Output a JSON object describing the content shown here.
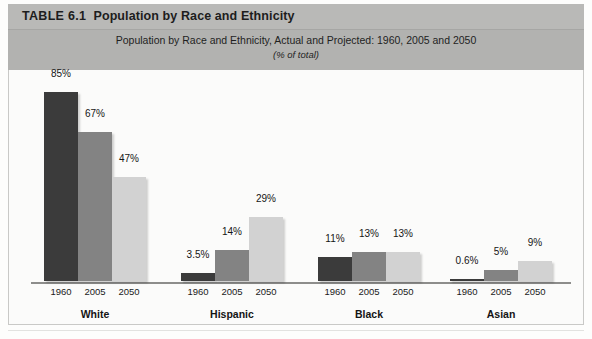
{
  "header": {
    "table_number": "TABLE 6.1",
    "table_title": "Population by Race and Ethnicity",
    "subtitle": "Population by Race and Ethnicity, Actual and Projected: 1960, 2005 and 2050",
    "units_note": "(% of total)"
  },
  "colors": {
    "series_1960": "#3b3b3b",
    "series_2005": "#838383",
    "series_2050": "#d2d2d2",
    "header_band": "#b4b4b2",
    "plot_background": "#fbfbfa",
    "axis_line": "#8d8d8b"
  },
  "chart_data": {
    "type": "bar",
    "title": "Population by Race and Ethnicity, Actual and Projected: 1960, 2005 and 2050",
    "subtitle": "(% of total)",
    "xlabel": "",
    "ylabel": "",
    "ylim": [
      0,
      90
    ],
    "grid": false,
    "legend_position": "none",
    "categories": [
      "White",
      "Hispanic",
      "Black",
      "Asian"
    ],
    "series": [
      {
        "name": "1960",
        "color": "#3b3b3b",
        "values": [
          85,
          3.5,
          11,
          0.6
        ],
        "labels": [
          "85%",
          "3.5%",
          "11%",
          "0.6%"
        ]
      },
      {
        "name": "2005",
        "color": "#838383",
        "values": [
          67,
          14,
          13,
          5
        ],
        "labels": [
          "67%",
          "14%",
          "13%",
          "5%"
        ]
      },
      {
        "name": "2050",
        "color": "#d2d2d2",
        "values": [
          47,
          29,
          13,
          9
        ],
        "labels": [
          "47%",
          "29%",
          "13%",
          "9%"
        ]
      }
    ],
    "groups": [
      {
        "name": "White",
        "bars": [
          {
            "year": "1960",
            "value": 85,
            "label": "85%",
            "color_key": "c0"
          },
          {
            "year": "2005",
            "value": 67,
            "label": "67%",
            "color_key": "c1"
          },
          {
            "year": "2050",
            "value": 47,
            "label": "47%",
            "color_key": "c2"
          }
        ]
      },
      {
        "name": "Hispanic",
        "bars": [
          {
            "year": "1960",
            "value": 3.5,
            "label": "3.5%",
            "color_key": "c0"
          },
          {
            "year": "2005",
            "value": 14,
            "label": "14%",
            "color_key": "c1"
          },
          {
            "year": "2050",
            "value": 29,
            "label": "29%",
            "color_key": "c2"
          }
        ]
      },
      {
        "name": "Black",
        "bars": [
          {
            "year": "1960",
            "value": 11,
            "label": "11%",
            "color_key": "c0"
          },
          {
            "year": "2005",
            "value": 13,
            "label": "13%",
            "color_key": "c1"
          },
          {
            "year": "2050",
            "value": 13,
            "label": "13%",
            "color_key": "c2"
          }
        ]
      },
      {
        "name": "Asian",
        "bars": [
          {
            "year": "1960",
            "value": 0.6,
            "label": "0.6%",
            "color_key": "c0"
          },
          {
            "year": "2005",
            "value": 5,
            "label": "5%",
            "color_key": "c1"
          },
          {
            "year": "2050",
            "value": 9,
            "label": "9%",
            "color_key": "c2"
          }
        ]
      }
    ]
  }
}
